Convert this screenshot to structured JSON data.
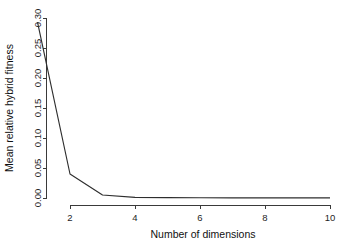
{
  "figure": {
    "background_color": "#ffffff",
    "line_color": "#2e2e2e",
    "axis_color": "#3a3a3a",
    "clipped_top_text": ""
  },
  "chart_data": {
    "type": "line",
    "title": "",
    "xlabel": "Number of dimensions",
    "ylabel": "Mean relative hybrid fitness",
    "x": [
      1,
      2,
      3,
      4,
      5,
      6,
      7,
      8,
      9,
      10
    ],
    "values": [
      0.293,
      0.04,
      0.005,
      0.001,
      0.0006,
      0.0004,
      0.0003,
      0.0002,
      0.0002,
      0.0001
    ],
    "series": [
      {
        "name": "Mean relative hybrid fitness",
        "values": [
          0.293,
          0.04,
          0.005,
          0.001,
          0.0006,
          0.0004,
          0.0003,
          0.0002,
          0.0002,
          0.0001
        ]
      }
    ],
    "xlim": [
      1,
      10
    ],
    "ylim": [
      0.0,
      0.3
    ],
    "xticks": [
      2,
      4,
      6,
      8,
      10
    ],
    "xtick_labels": [
      "2",
      "4",
      "6",
      "8",
      "10"
    ],
    "yticks": [
      0.0,
      0.05,
      0.1,
      0.15,
      0.2,
      0.25,
      0.3
    ],
    "ytick_labels": [
      "0.00",
      "0.05",
      "0.10",
      "0.15",
      "0.20",
      "0.25",
      "0.30"
    ],
    "grid": false,
    "legend": null,
    "legend_position": "none",
    "annotations": []
  }
}
